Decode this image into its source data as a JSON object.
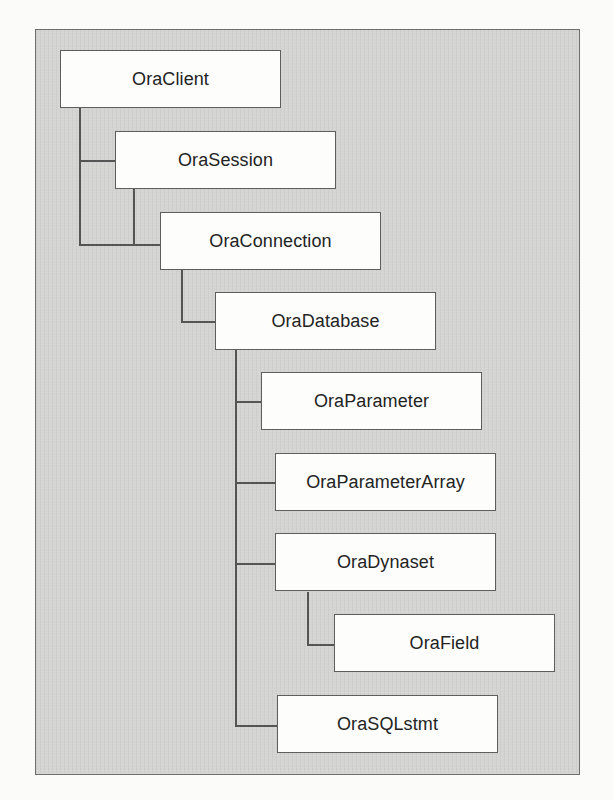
{
  "diagram": {
    "type": "object-hierarchy",
    "nodes": [
      {
        "id": "OraClient",
        "label": "OraClient",
        "parent": null
      },
      {
        "id": "OraSession",
        "label": "OraSession",
        "parent": "OraClient"
      },
      {
        "id": "OraConnection",
        "label": "OraConnection",
        "parent": "OraSession"
      },
      {
        "id": "OraDatabase",
        "label": "OraDatabase",
        "parent": "OraConnection"
      },
      {
        "id": "OraParameter",
        "label": "OraParameter",
        "parent": "OraDatabase"
      },
      {
        "id": "OraParameterArray",
        "label": "OraParameterArray",
        "parent": "OraDatabase"
      },
      {
        "id": "OraDynaset",
        "label": "OraDynaset",
        "parent": "OraDatabase"
      },
      {
        "id": "OraField",
        "label": "OraField",
        "parent": "OraDynaset"
      },
      {
        "id": "OraSQLstmt",
        "label": "OraSQLstmt",
        "parent": "OraDatabase"
      }
    ]
  },
  "colors": {
    "panel_background": "#d4d4d2",
    "node_background": "#fdfdfc",
    "border": "#5e5e5e",
    "text": "#232323"
  }
}
